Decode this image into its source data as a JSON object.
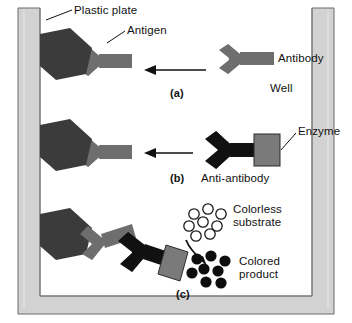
{
  "figure": {
    "canvas": {
      "width": 352,
      "height": 323
    }
  },
  "colors": {
    "background": "#ffffff",
    "well_fill": "#d2d2d2",
    "well_stroke": "#555555",
    "interior": "#ffffff",
    "antigen": "#3b3b3b",
    "antibody": "#6e6e6e",
    "anti_antibody": "#111111",
    "enzyme": "#7a7a7a",
    "enzyme_stroke": "#2b2b2b",
    "substrate_stroke": "#1a1a1a",
    "product_fill": "#0d0d0d",
    "leader_line": "#111111",
    "arrow": "#111111",
    "text": "#111111"
  },
  "labels": {
    "plastic_plate": "Plastic plate",
    "antigen": "Antigen",
    "antibody": "Antibody",
    "well": "Well",
    "enzyme": "Enzyme",
    "anti_antibody": "Anti-antibody",
    "colorless_substrate_line1": "Colorless",
    "colorless_substrate_line2": "substrate",
    "colored_product_line1": "Colored",
    "colored_product_line2": "product"
  },
  "panels": [
    {
      "id": "a",
      "caption": "(a)",
      "description": "Antigen coated on plastic plate binds the primary antibody added to the well."
    },
    {
      "id": "b",
      "caption": "(b)",
      "description": "Enzyme-linked anti-antibody is added and binds the primary antibody."
    },
    {
      "id": "c",
      "caption": "(c)",
      "description": "Enzyme converts colorless substrate into colored product."
    }
  ],
  "species": {
    "antigen": {
      "shape": "hexagon",
      "count_per_panel": 1,
      "panels": [
        "a",
        "b",
        "c"
      ]
    },
    "antibody": {
      "shape": "y-shape",
      "color_name": "gray"
    },
    "anti_antibody": {
      "shape": "y-shape",
      "color_name": "black"
    },
    "enzyme": {
      "shape": "square"
    },
    "colorless_substrate": {
      "shape": "open-circle",
      "count": 8
    },
    "colored_product": {
      "shape": "filled-circle",
      "count": 8
    }
  },
  "arrows": {
    "panel_a": {
      "direction": "left",
      "meaning": "antibody added to well"
    },
    "panel_b": {
      "direction": "left",
      "meaning": "anti-antibody added to well"
    },
    "panel_c": {
      "direction": "curved-down",
      "meaning": "substrate converted to product"
    }
  }
}
